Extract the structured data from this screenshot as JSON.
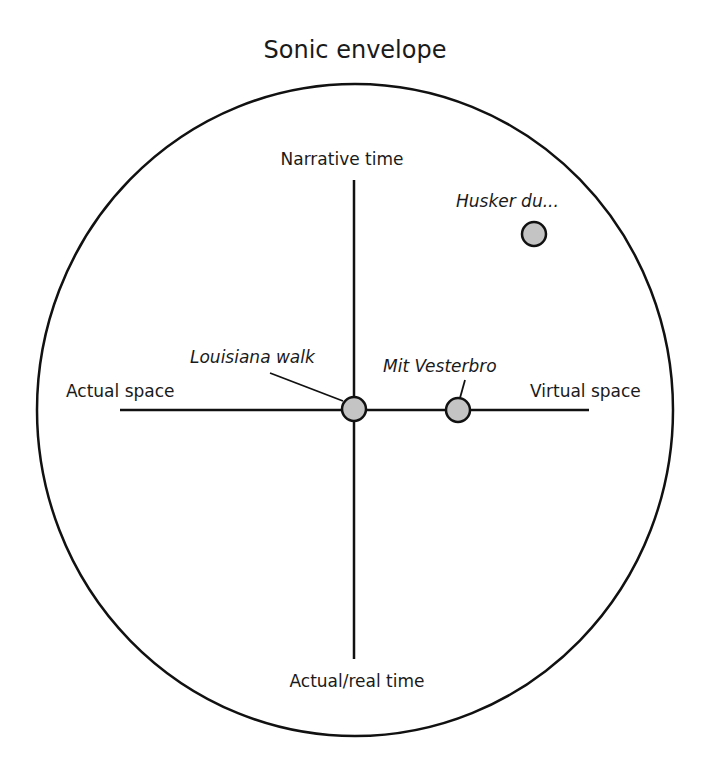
{
  "title": "Sonic envelope",
  "axes": {
    "top": "Narrative time",
    "bottom": "Actual/real time",
    "left": "Actual space",
    "right": "Virtual space"
  },
  "items": [
    {
      "label": "Louisiana walk",
      "position": "center (actual space / narrative-real time midpoint)"
    },
    {
      "label": "Mit Vesterbro",
      "position": "on horizontal axis toward virtual space"
    },
    {
      "label": "Husker du...",
      "position": "upper right quadrant (narrative time, virtual space)"
    }
  ],
  "colors": {
    "stroke": "#111111",
    "dot_fill": "#c4c4c4",
    "background": "#ffffff"
  }
}
